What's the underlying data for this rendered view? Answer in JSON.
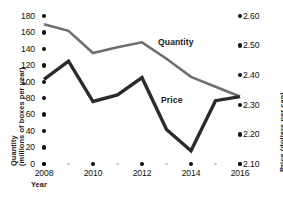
{
  "chart_data": {
    "type": "line",
    "title": "",
    "xlabel": "Year",
    "x": [
      2008,
      2009,
      2010,
      2011,
      2012,
      2013,
      2014,
      2015,
      2016
    ],
    "xtick_labels": [
      "2008",
      "2010",
      "2012",
      "2014",
      "2016"
    ],
    "xtick_values": [
      2008,
      2010,
      2012,
      2014,
      2016
    ],
    "xlim": [
      2008,
      2016
    ],
    "grid": false,
    "legend": "inline-labels",
    "axes": [
      {
        "id": "left",
        "label_line1": "Quantity",
        "label_line2": "(millions of boxes per year)",
        "ticks": [
          0,
          20,
          40,
          60,
          80,
          100,
          120,
          140,
          160,
          180
        ],
        "tick_labels": [
          "0",
          "20",
          "40",
          "60",
          "80",
          "100",
          "120",
          "140",
          "160",
          "180"
        ],
        "lim": [
          0,
          180
        ]
      },
      {
        "id": "right",
        "label_line1": "Price (dollars per can)",
        "ticks": [
          2.1,
          2.2,
          2.3,
          2.4,
          2.5,
          2.6
        ],
        "tick_labels": [
          "2.10",
          "2.20",
          "2.30",
          "2.40",
          "2.50",
          "2.60"
        ],
        "lim": [
          2.1,
          2.6
        ]
      }
    ],
    "series": [
      {
        "name": "Quantity",
        "axis": "left",
        "unit": "millions of boxes per year",
        "color": "#6e6e6e",
        "values": [
          170,
          162,
          135,
          142,
          148,
          128,
          106,
          94,
          82
        ]
      },
      {
        "name": "Price",
        "axis": "right",
        "unit": "dollars per can",
        "color": "#2b2b2b",
        "values": [
          2.39,
          2.45,
          2.31,
          2.33,
          2.39,
          2.22,
          2.14,
          2.31,
          2.32
        ]
      }
    ],
    "series_price_on_left_scale": [
      103,
      125,
      76,
      84,
      105,
      42,
      16,
      77,
      82
    ],
    "annotations": [
      {
        "text": "Quantity",
        "series": "Quantity"
      },
      {
        "text": "Price",
        "series": "Price"
      }
    ]
  },
  "colors": {
    "quantity_line": "#6e6e6e",
    "price_line": "#2b2b2b",
    "tick_dot": "#111111",
    "minor_dot": "#c9c9c9",
    "text": "#1a1a1a",
    "background": "#ffffff"
  }
}
